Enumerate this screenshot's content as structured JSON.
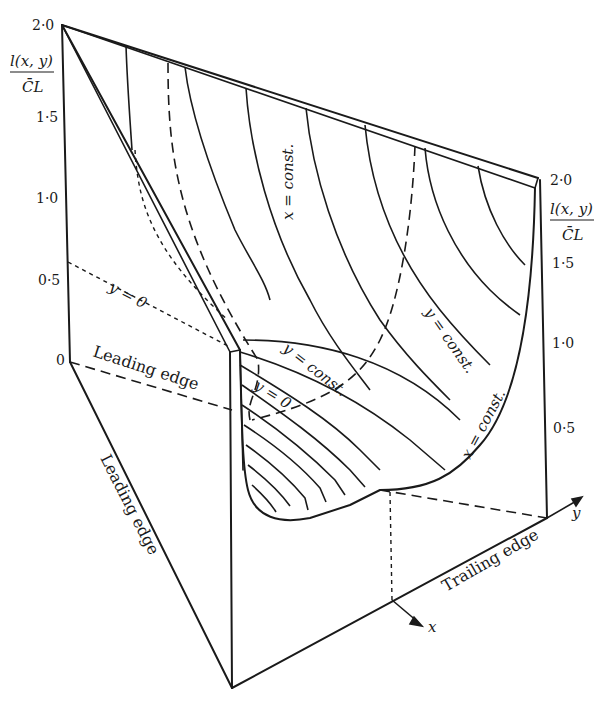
{
  "figure": {
    "type": "3D surface diagram of spanwise lift distribution",
    "left_axis": {
      "label_numerator": "l(x, y)",
      "label_denominator": "C̄L",
      "ticks": [
        "2·0",
        "1·5",
        "1·0",
        "0·5",
        "0"
      ]
    },
    "right_axis": {
      "label_numerator": "l(x, y)",
      "label_denominator": "C̄L",
      "ticks": [
        "2·0",
        "1·5",
        "1·0",
        "0·5"
      ]
    },
    "labels": {
      "x_const_upper": "x = const.",
      "x_const_right": "x = const.",
      "y_zero_left": "y = 0",
      "y_zero_center": "y = 0",
      "y_const_center": "y = const.",
      "y_const_right": "y = const.",
      "leading_edge_top": "Leading edge",
      "leading_edge_side": "Leading edge",
      "trailing_edge": "Trailing edge",
      "x_axis": "x",
      "y_axis": "y"
    },
    "colors": {
      "ink": "#1a1a1a",
      "background": "#ffffff"
    }
  }
}
